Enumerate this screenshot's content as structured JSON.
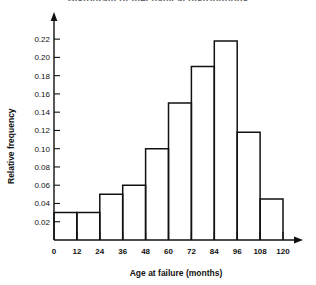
{
  "chart_data": {
    "type": "bar",
    "title": "Histogram of mechanical distributions",
    "xlabel": "Age at failure (months)",
    "ylabel": "Relative frequency",
    "categories": [
      "0-12",
      "12-24",
      "24-36",
      "36-48",
      "48-60",
      "60-72",
      "72-84",
      "84-96",
      "96-108",
      "108-120"
    ],
    "bin_edges": [
      0,
      12,
      24,
      36,
      48,
      60,
      72,
      84,
      96,
      108,
      120
    ],
    "values": [
      0.03,
      0.03,
      0.05,
      0.06,
      0.1,
      0.15,
      0.19,
      0.218,
      0.118,
      0.045
    ],
    "xlim": [
      0,
      120
    ],
    "ylim": [
      0,
      0.23
    ],
    "xticks": [
      0,
      12,
      24,
      36,
      48,
      60,
      72,
      84,
      96,
      108,
      120
    ],
    "xtick_labels": [
      "0",
      "12",
      "24",
      "36",
      "48",
      "60",
      "72",
      "84",
      "96",
      "108",
      "120"
    ],
    "yticks": [
      0.02,
      0.04,
      0.06,
      0.08,
      0.1,
      0.12,
      0.14,
      0.16,
      0.18,
      0.2,
      0.22
    ],
    "ytick_labels": [
      "0.02",
      "0.04",
      "0.06",
      "0.08",
      "0.10",
      "0.12",
      "0.14",
      "0.16",
      "0.18",
      "0.20",
      "0.22"
    ],
    "grid": false,
    "legend": null,
    "bar_style": "outline",
    "bar_fill": "#ffffff",
    "bar_stroke": "#111111",
    "axis_color": "#111111",
    "background": "#ffffff"
  }
}
